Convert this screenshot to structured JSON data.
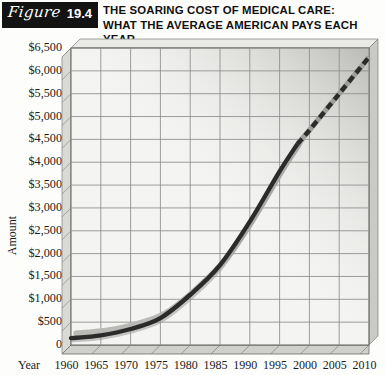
{
  "figure": {
    "badge_word": "Figure",
    "badge_number": "19.4",
    "badge_color": "#131313"
  },
  "title": {
    "line1": "THE SOARING COST OF MEDICAL CARE:",
    "line2": "WHAT THE AVERAGE AMERICAN PAYS EACH YEAR"
  },
  "axis": {
    "y_title": "Amount",
    "x_title": "Year"
  },
  "chart_data": {
    "type": "line",
    "title": "THE SOARING COST OF MEDICAL CARE: WHAT THE AVERAGE AMERICAN PAYS EACH YEAR",
    "xlabel": "Year",
    "ylabel": "Amount",
    "xlim": [
      1960,
      2010
    ],
    "ylim": [
      0,
      6500
    ],
    "grid": true,
    "legend": "none",
    "xtick_labels": [
      "1960",
      "1965",
      "1970",
      "1975",
      "1980",
      "1985",
      "1990",
      "1995",
      "2000",
      "2005",
      "2010"
    ],
    "ytick_labels": [
      "0",
      "$500",
      "$1,000",
      "$1,500",
      "$2,000",
      "$2,500",
      "$3,000",
      "$3,500",
      "$4,000",
      "$4,500",
      "$5,000",
      "$5,500",
      "$6,000",
      "$6,500"
    ],
    "ytick_values": [
      0,
      500,
      1000,
      1500,
      2000,
      2500,
      3000,
      3500,
      4000,
      4500,
      5000,
      5500,
      6000,
      6500
    ],
    "x": [
      1960,
      1965,
      1970,
      1975,
      1980,
      1985,
      1990,
      1995,
      2000,
      2005,
      2010
    ],
    "values": [
      150,
      210,
      350,
      590,
      1100,
      1750,
      2700,
      3800,
      4700,
      5500,
      6300
    ],
    "series": [
      {
        "name": "Average American medical cost per year",
        "style": "solid",
        "note": "actual",
        "x": [
          1960,
          1965,
          1970,
          1975,
          1980,
          1985,
          1990,
          1995,
          1998
        ],
        "values": [
          150,
          210,
          350,
          590,
          1100,
          1750,
          2700,
          3800,
          4400
        ]
      },
      {
        "name": "Projection",
        "style": "dashed",
        "note": "projected",
        "x": [
          1998,
          2000,
          2005,
          2010
        ],
        "values": [
          4400,
          4700,
          5500,
          6300
        ]
      }
    ],
    "annotations": [
      "Projected portion shown as dashed line from about 1998 onward"
    ]
  },
  "colors": {
    "line": "#2b2b2b",
    "grid": "#8c8c8c",
    "plot_bg": "#f4f4f2",
    "wall": "#d9d9d6",
    "floor": "#cfcfcb"
  }
}
